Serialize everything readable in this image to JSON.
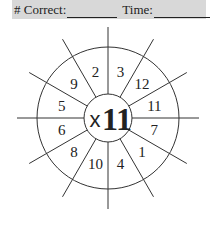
{
  "header": {
    "correct_label": "# Correct:",
    "time_label": "Time:"
  },
  "wheel": {
    "center_operator": "x",
    "center_number": "11",
    "sectors": [
      "3",
      "12",
      "11",
      "7",
      "1",
      "4",
      "10",
      "8",
      "6",
      "5",
      "9",
      "2"
    ]
  },
  "colors": {
    "header_background": "#d8d8d8",
    "ink": "#222222"
  }
}
